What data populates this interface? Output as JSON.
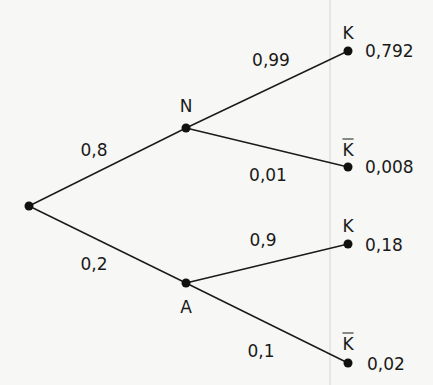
{
  "diagram": {
    "type": "probability-tree",
    "background_color": "#f7f7f5",
    "line_color": "#1a1a1a",
    "root": {
      "x": 29,
      "y": 206
    },
    "level1": [
      {
        "label": "N",
        "prob": "0,8",
        "x": 186,
        "y": 128,
        "label_pos": {
          "x": 186,
          "y": 106
        },
        "prob_pos": {
          "x": 94,
          "y": 150
        }
      },
      {
        "label": "A",
        "prob": "0,2",
        "x": 186,
        "y": 283,
        "label_pos": {
          "x": 186,
          "y": 307
        },
        "prob_pos": {
          "x": 94,
          "y": 264
        }
      }
    ],
    "leaves": [
      {
        "label": "K",
        "overline": false,
        "prob": "0,99",
        "result": "0,792",
        "x": 348,
        "y": 51,
        "label_pos": {
          "x": 348,
          "y": 33
        },
        "prob_pos": {
          "x": 271,
          "y": 60
        },
        "result_pos": {
          "x": 365,
          "y": 51
        }
      },
      {
        "label": "K",
        "overline": true,
        "prob": "0,01",
        "result": "0,008",
        "x": 348,
        "y": 167,
        "label_pos": {
          "x": 348,
          "y": 150
        },
        "prob_pos": {
          "x": 268,
          "y": 175
        },
        "result_pos": {
          "x": 365,
          "y": 167
        }
      },
      {
        "label": "K",
        "overline": false,
        "prob": "0,9",
        "result": "0,18",
        "x": 348,
        "y": 244,
        "label_pos": {
          "x": 348,
          "y": 226
        },
        "prob_pos": {
          "x": 263,
          "y": 240
        },
        "result_pos": {
          "x": 365,
          "y": 245
        }
      },
      {
        "label": "K",
        "overline": true,
        "prob": "0,1",
        "result": "0,02",
        "x": 348,
        "y": 363,
        "label_pos": {
          "x": 348,
          "y": 344
        },
        "prob_pos": {
          "x": 261,
          "y": 351
        },
        "result_pos": {
          "x": 367,
          "y": 364
        }
      }
    ]
  },
  "labels": {
    "n": "N",
    "a": "A",
    "k1": "K",
    "k2": "K",
    "k3": "K",
    "k4": "K",
    "p_n": "0,8",
    "p_a": "0,2",
    "p_k1": "0,99",
    "p_k2": "0,01",
    "p_k3": "0,9",
    "p_k4": "0,1",
    "r1": "0,792",
    "r2": "0,008",
    "r3": "0,18",
    "r4": "0,02"
  }
}
